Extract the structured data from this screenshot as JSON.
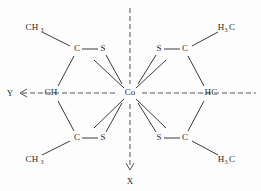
{
  "diagram": {
    "center_atom": "Co",
    "axes": [
      {
        "name": "y-axis",
        "label": "Y",
        "direction": "left"
      },
      {
        "name": "x-axis",
        "label": "X",
        "direction": "down"
      }
    ],
    "arms": [
      {
        "id": "upper-left",
        "methyl": "CH",
        "methyl_sub": "3",
        "carbon": "C",
        "sulfur": "S"
      },
      {
        "id": "upper-right",
        "methyl": "H",
        "methyl_sub": "3",
        "methyl_tail": "C",
        "carbon": "C",
        "sulfur": "S"
      },
      {
        "id": "lower-left",
        "methyl": "CH",
        "methyl_sub": "3",
        "carbon": "C",
        "sulfur": "S"
      },
      {
        "id": "lower-right",
        "methyl": "H",
        "methyl_sub": "3",
        "methyl_tail": "C",
        "carbon": "C",
        "sulfur": "S"
      }
    ],
    "equatorial": [
      {
        "id": "left",
        "label": "CH"
      },
      {
        "id": "right",
        "label": "HC"
      }
    ],
    "colors": {
      "bond": "#3a3a3a",
      "axis": "#555555",
      "text": "#2b2b2b",
      "background": "#fdfdfd"
    }
  }
}
